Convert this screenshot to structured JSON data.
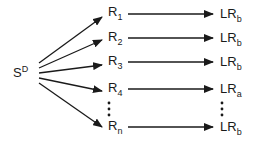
{
  "source": {
    "base": "S",
    "superscript": "D"
  },
  "receptors": [
    {
      "base": "R",
      "sub": "1",
      "target_base": "LR",
      "target_sub": "b"
    },
    {
      "base": "R",
      "sub": "2",
      "target_base": "LR",
      "target_sub": "b"
    },
    {
      "base": "R",
      "sub": "3",
      "target_base": "LR",
      "target_sub": "b"
    },
    {
      "base": "R",
      "sub": "4",
      "target_base": "LR",
      "target_sub": "a"
    },
    {
      "base": "R",
      "sub": "n",
      "target_base": "LR",
      "target_sub": "b"
    }
  ],
  "ellipsis": "⋮",
  "colors": {
    "ink": "#1a1a1a",
    "background": "#ffffff"
  }
}
